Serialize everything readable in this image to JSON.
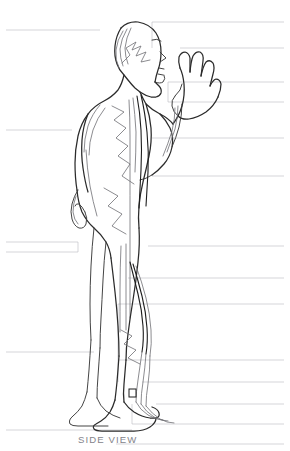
{
  "figure": {
    "caption": "SIDE VIEW",
    "ink_color": "#2b2b2b",
    "label_color": "#83838a",
    "leader_color": "#b9b9bf",
    "background": "#ffffff"
  },
  "labels_left": [
    {
      "text": "Small Intestine",
      "x": 8,
      "y": 18,
      "leader_y": 30,
      "leader_x_end": 100
    },
    {
      "text": "Lung",
      "x": 8,
      "y": 118,
      "leader_y": 130,
      "leader_x_end": 72
    },
    {
      "text": "Triple Burner",
      "x": 8,
      "y": 230,
      "leader_y": 242,
      "leader_x_end": 78
    },
    {
      "text": "Large Intestine",
      "x": 8,
      "y": 262,
      "leader_y": 252,
      "leader_x_end": 78
    },
    {
      "text": "Bladder",
      "x": 8,
      "y": 358,
      "leader_y": 352,
      "leader_x_end": 94
    },
    {
      "text": "Gall Bladder",
      "x": 8,
      "y": 436,
      "leader_y": 430,
      "leader_x_end": 132
    }
  ],
  "labels_right": [
    {
      "text": "Directing Vessel",
      "y": 10,
      "leader_y": 22,
      "leader_x_start": 152
    },
    {
      "text": "Lung",
      "y": 36,
      "leader_y": 48,
      "leader_x_start": 180
    },
    {
      "text": "Pericardium",
      "y": 70,
      "leader_y": 82,
      "leader_x_start": 168
    },
    {
      "text": "Heart",
      "y": 90,
      "leader_y": 102,
      "leader_x_start": 168
    },
    {
      "text": "Kidney",
      "y": 126,
      "leader_y": 138,
      "leader_x_start": 152
    },
    {
      "text": "Spleen",
      "y": 164,
      "leader_y": 176,
      "leader_x_start": 152
    },
    {
      "text": "Hip bone",
      "y": 234,
      "leader_y": 246,
      "leader_x_start": 148
    },
    {
      "text": "Spleen",
      "y": 266,
      "leader_y": 278,
      "leader_x_start": 128
    },
    {
      "text": "Liver",
      "y": 292,
      "leader_y": 304,
      "leader_x_start": 118
    },
    {
      "text": "Kidney",
      "y": 348,
      "leader_y": 360,
      "leader_x_start": 118
    },
    {
      "text": "Liver",
      "y": 370,
      "leader_y": 382,
      "leader_x_start": 142
    },
    {
      "text": "Spleen",
      "y": 392,
      "leader_y": 404,
      "leader_x_start": 156
    },
    {
      "text": "Kidney",
      "y": 412,
      "leader_y": 424,
      "leader_x_start": 132
    },
    {
      "text": "Stomach",
      "y": 432,
      "leader_y": 444,
      "leader_x_start": 116
    }
  ]
}
